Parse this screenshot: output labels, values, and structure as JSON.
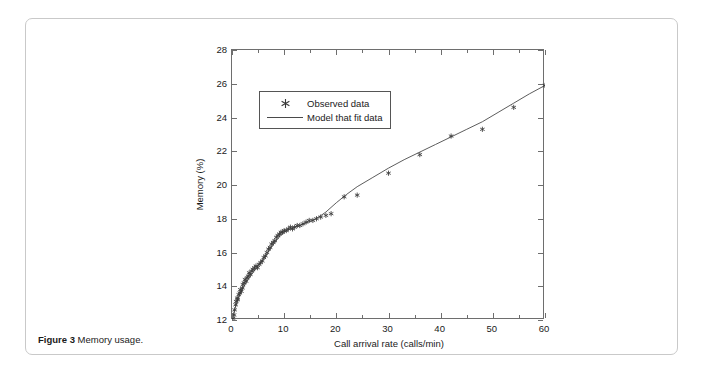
{
  "caption": {
    "label": "Figure 3",
    "text": " Memory usage."
  },
  "chart_data": {
    "type": "scatter",
    "title": "",
    "xlabel": "Call arrival rate (calls/min)",
    "ylabel": "Memory (%)",
    "xlim": [
      0,
      60
    ],
    "ylim": [
      12,
      28
    ],
    "xticks": [
      0,
      10,
      20,
      30,
      40,
      50,
      60
    ],
    "xtick_labels": [
      "0",
      "10",
      "20",
      "30",
      "40",
      "50",
      "60"
    ],
    "xminor_ticks": [
      5,
      15,
      25,
      35,
      45,
      55
    ],
    "yticks": [
      12,
      14,
      16,
      18,
      20,
      22,
      24,
      26,
      28
    ],
    "ytick_labels": [
      "12",
      "14",
      "16",
      "18",
      "20",
      "22",
      "24",
      "26",
      "28"
    ],
    "grid": false,
    "legend_position": "upper-left",
    "marker_color": "#3a3a3a",
    "line_color": "#4a4a4a",
    "legend": [
      {
        "name": "Observed data",
        "key": "marker"
      },
      {
        "name": "Model that fit data",
        "key": "line"
      }
    ],
    "series": [
      {
        "name": "Observed data",
        "type": "scatter",
        "marker": "star",
        "x": [
          0.2,
          0.4,
          0.5,
          0.7,
          0.8,
          1.0,
          1.1,
          1.3,
          1.5,
          1.6,
          1.8,
          2.0,
          2.1,
          2.3,
          2.5,
          2.7,
          2.9,
          3.1,
          3.3,
          3.5,
          3.8,
          4.0,
          4.3,
          4.6,
          4.9,
          5.2,
          5.5,
          5.8,
          6.1,
          6.4,
          6.7,
          7.0,
          7.3,
          7.6,
          7.9,
          8.2,
          8.5,
          8.8,
          9.1,
          9.4,
          9.7,
          10.0,
          10.4,
          10.8,
          11.2,
          11.6,
          12.0,
          12.5,
          13.0,
          13.6,
          14.2,
          14.8,
          15.5,
          16.2,
          17.0,
          18.0,
          19.0,
          21.5,
          24.0,
          30.0,
          36.0,
          42.0,
          48.0,
          54.0,
          60.0
        ],
        "y": [
          12.1,
          12.3,
          12.6,
          12.9,
          13.1,
          13.3,
          13.2,
          13.5,
          13.6,
          13.8,
          13.7,
          13.9,
          14.1,
          14.2,
          14.4,
          14.3,
          14.5,
          14.6,
          14.8,
          14.7,
          14.9,
          15.0,
          15.1,
          15.2,
          15.1,
          15.3,
          15.4,
          15.5,
          15.7,
          15.8,
          16.0,
          16.2,
          16.3,
          16.5,
          16.6,
          16.7,
          16.9,
          17.0,
          17.1,
          17.2,
          17.2,
          17.3,
          17.3,
          17.4,
          17.5,
          17.4,
          17.5,
          17.6,
          17.6,
          17.7,
          17.8,
          17.9,
          17.9,
          18.0,
          18.1,
          18.2,
          18.3,
          19.3,
          19.4,
          20.7,
          21.8,
          22.9,
          23.3,
          24.6,
          25.9
        ]
      },
      {
        "name": "Model that fit data",
        "type": "line",
        "x": [
          0,
          0.5,
          1,
          1.5,
          2,
          3,
          4,
          5,
          6,
          7,
          8,
          9,
          10,
          11,
          12,
          13,
          14,
          15,
          16,
          17,
          18,
          20,
          22,
          24,
          27,
          30,
          33,
          36,
          39,
          42,
          45,
          48,
          51,
          54,
          57,
          60
        ],
        "y": [
          12.0,
          12.6,
          13.1,
          13.5,
          13.85,
          14.35,
          14.8,
          15.2,
          15.6,
          16.05,
          16.5,
          16.9,
          17.2,
          17.38,
          17.5,
          17.6,
          17.72,
          17.85,
          18.0,
          18.18,
          18.4,
          18.95,
          19.45,
          19.9,
          20.45,
          21.0,
          21.5,
          21.95,
          22.4,
          22.85,
          23.3,
          23.75,
          24.3,
          24.85,
          25.4,
          25.9
        ]
      }
    ]
  }
}
